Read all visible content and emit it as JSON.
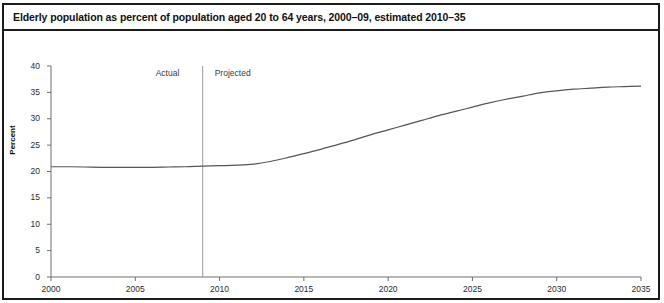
{
  "figure": {
    "title": "Elderly population as percent of population aged 20 to 64 years, 2000–09, estimated 2010–35",
    "border_color": "#1c1c1c",
    "background": "#ffffff"
  },
  "chart_data": {
    "type": "line",
    "title": "Elderly population as percent of population aged 20 to 64 years, 2000–09, estimated 2010–35",
    "xlabel": "",
    "ylabel": "Percent",
    "xlim": [
      2000,
      2035
    ],
    "ylim": [
      0,
      40
    ],
    "grid": false,
    "legend": "none",
    "line_color": "#555555",
    "x_ticks": [
      2000,
      2005,
      2010,
      2015,
      2020,
      2025,
      2030,
      2035
    ],
    "x_tick_labels": [
      "2000",
      "2005",
      "2010",
      "2015",
      "2020",
      "2025",
      "2030",
      "2035"
    ],
    "y_ticks": [
      0,
      5,
      10,
      15,
      20,
      25,
      30,
      35,
      40
    ],
    "y_tick_labels": [
      "0",
      "5",
      "10",
      "15",
      "20",
      "25",
      "30",
      "35",
      "40"
    ],
    "series": [
      {
        "name": "Elderly population as percent of population aged 20 to 64 years",
        "x": [
          2000,
          2001,
          2002,
          2003,
          2004,
          2005,
          2006,
          2007,
          2008,
          2009,
          2010,
          2011,
          2012,
          2013,
          2014,
          2015,
          2016,
          2017,
          2018,
          2019,
          2020,
          2021,
          2022,
          2023,
          2024,
          2025,
          2026,
          2027,
          2028,
          2029,
          2030,
          2031,
          2032,
          2033,
          2034,
          2035
        ],
        "values": [
          20.9,
          20.9,
          20.85,
          20.8,
          20.8,
          20.8,
          20.8,
          20.85,
          20.9,
          21.0,
          21.1,
          21.2,
          21.4,
          21.9,
          22.6,
          23.4,
          24.2,
          25.1,
          26.0,
          27.0,
          27.9,
          28.8,
          29.7,
          30.6,
          31.4,
          32.2,
          33.0,
          33.7,
          34.3,
          34.9,
          35.3,
          35.6,
          35.8,
          36.0,
          36.1,
          36.2
        ]
      }
    ],
    "annotations": [
      {
        "text": "Actual",
        "x": 2006.2,
        "y": 38.4
      },
      {
        "text": "Projected",
        "x": 2011.6,
        "y": 38.4
      }
    ],
    "divider": {
      "x": 2009,
      "label_left": "Actual",
      "label_right": "Projected"
    }
  },
  "axes": {
    "y_title": "Percent"
  },
  "annotations": {
    "actual": "Actual",
    "projected": "Projected"
  }
}
